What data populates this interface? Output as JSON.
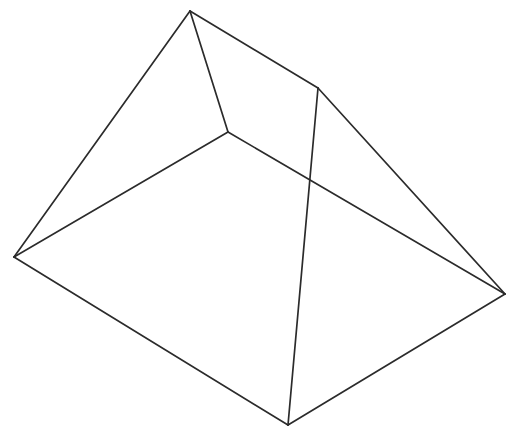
{
  "figure": {
    "name": "pyramid-line-drawing",
    "title": "Pyramid wireframe line drawing",
    "background_color": "#ffffff",
    "stroke_color": "#2b2b2b",
    "stroke_width": 1.7,
    "canvas": {
      "width": 518,
      "height": 435
    },
    "vertices": [
      {
        "id": "apex",
        "label": "apex",
        "x": 190,
        "y": 11
      },
      {
        "id": "left",
        "label": "left corner",
        "x": 14,
        "y": 257
      },
      {
        "id": "right",
        "label": "right corner",
        "x": 505,
        "y": 294
      },
      {
        "id": "bottom",
        "label": "bottom corner",
        "x": 288,
        "y": 425
      },
      {
        "id": "interior",
        "label": "interior junction",
        "x": 228,
        "y": 132
      },
      {
        "id": "ridge_end",
        "label": "ridge end",
        "x": 318,
        "y": 88
      }
    ],
    "edges": [
      {
        "id": "apex-left",
        "from": "apex",
        "to": "left",
        "d": "M 190 11 L 14 257"
      },
      {
        "id": "apex-interior",
        "from": "apex",
        "to": "interior",
        "d": "M 190 11 L 228 132"
      },
      {
        "id": "apex-ridge-end",
        "from": "apex",
        "to": "ridge_end",
        "d": "M 190 11 L 318 88"
      },
      {
        "id": "interior-left",
        "from": "interior",
        "to": "left",
        "d": "M 228 132 L 14 257"
      },
      {
        "id": "interior-right",
        "from": "interior",
        "to": "right",
        "d": "M 228 132 L 505 294"
      },
      {
        "id": "ridge-end-right",
        "from": "ridge_end",
        "to": "right",
        "d": "M 318 88 L 505 294"
      },
      {
        "id": "ridge-end-bottom",
        "from": "ridge_end",
        "to": "bottom",
        "d": "M 318 88 L 288 425"
      },
      {
        "id": "left-bottom",
        "from": "left",
        "to": "bottom",
        "d": "M 14 257 L 288 425"
      },
      {
        "id": "bottom-right",
        "from": "bottom",
        "to": "right",
        "d": "M 288 425 L 505 294"
      }
    ]
  }
}
